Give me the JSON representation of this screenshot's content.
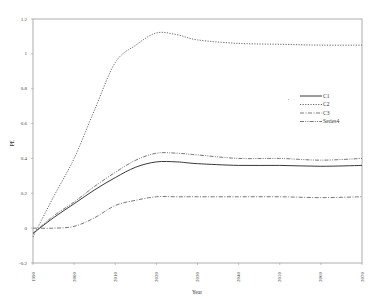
{
  "chart_data": {
    "type": "line",
    "title": "",
    "xlabel": "Year",
    "ylabel": "PE",
    "xlim": [
      1990,
      2070
    ],
    "ylim": [
      -0.2,
      1.2
    ],
    "x_ticks": [
      "1990",
      "2000",
      "2010",
      "2020",
      "2030",
      "2040",
      "2050",
      "2060",
      "2070"
    ],
    "y_ticks": [
      "1.2",
      "1",
      "0.8",
      "0.6",
      "0.4",
      "0.2",
      "0",
      "-0.2"
    ],
    "grid": false,
    "legend_position": "right-middle",
    "x": [
      1990,
      1995,
      2000,
      2005,
      2010,
      2015,
      2020,
      2025,
      2030,
      2040,
      2050,
      2060,
      2070
    ],
    "series": [
      {
        "name": "C1",
        "style": "solid",
        "values": [
          -0.03,
          0.06,
          0.14,
          0.22,
          0.29,
          0.35,
          0.38,
          0.38,
          0.37,
          0.36,
          0.36,
          0.355,
          0.36
        ]
      },
      {
        "name": "C2",
        "style": "dotted",
        "values": [
          -0.05,
          0.18,
          0.4,
          0.68,
          0.95,
          1.05,
          1.12,
          1.11,
          1.08,
          1.06,
          1.055,
          1.05,
          1.05
        ]
      },
      {
        "name": "C3",
        "style": "dash-dot",
        "values": [
          0.0,
          0.0,
          0.01,
          0.06,
          0.13,
          0.16,
          0.18,
          0.18,
          0.18,
          0.18,
          0.18,
          0.175,
          0.18
        ]
      },
      {
        "name": "Series4",
        "style": "dash-dot-dot",
        "values": [
          -0.03,
          0.07,
          0.15,
          0.24,
          0.32,
          0.39,
          0.43,
          0.43,
          0.42,
          0.4,
          0.4,
          0.39,
          0.4
        ]
      }
    ]
  }
}
